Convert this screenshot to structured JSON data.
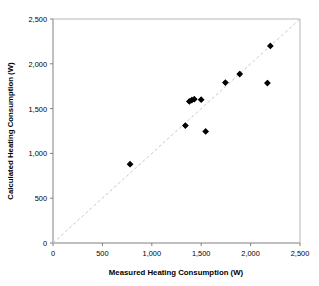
{
  "chart_data": {
    "type": "scatter",
    "title": "",
    "xlabel": "Measured Heating Consumption (W)",
    "ylabel": "Calculated Heating Consumption (W)",
    "xlim": [
      0,
      2500
    ],
    "ylim": [
      0,
      2500
    ],
    "grid": false,
    "legend": "none",
    "x_ticks": [
      "0",
      "500",
      "1,000",
      "1,500",
      "2,000",
      "2,500"
    ],
    "x_tick_values": [
      0,
      500,
      1000,
      1500,
      2000,
      2500
    ],
    "y_ticks": [
      "0",
      "500",
      "1,000",
      "1,500",
      "2,000",
      "2,500"
    ],
    "y_tick_values": [
      0,
      500,
      1000,
      1500,
      2000,
      2500
    ],
    "marker": "diamond",
    "marker_color": "#000000",
    "points": [
      {
        "x": 780,
        "y": 880
      },
      {
        "x": 1340,
        "y": 1310
      },
      {
        "x": 1380,
        "y": 1580
      },
      {
        "x": 1405,
        "y": 1595
      },
      {
        "x": 1430,
        "y": 1605
      },
      {
        "x": 1500,
        "y": 1600
      },
      {
        "x": 1545,
        "y": 1245
      },
      {
        "x": 1745,
        "y": 1790
      },
      {
        "x": 1890,
        "y": 1885
      },
      {
        "x": 2170,
        "y": 1785
      },
      {
        "x": 2200,
        "y": 2200
      }
    ],
    "reference_line": {
      "name": "one-to-one-line",
      "style": "dashed",
      "color": "#c8c8c8",
      "from": [
        0,
        0
      ],
      "to": [
        2500,
        2500
      ]
    }
  },
  "axes": {
    "x_title": "Measured Heating Consumption (W)",
    "y_title": "Calculated Heating Consumption (W)"
  }
}
